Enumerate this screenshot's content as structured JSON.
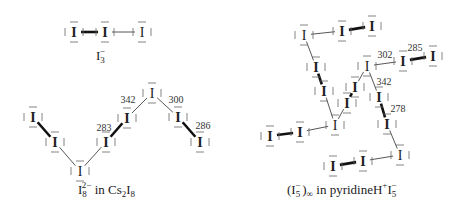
{
  "diagram": {
    "panels": [
      {
        "id": "i3",
        "caption": {
          "base": "I",
          "sub": "3",
          "sup": "−"
        },
        "atoms": [
          {
            "x": 74,
            "y": 32,
            "label": "I",
            "bold": true
          },
          {
            "x": 105,
            "y": 32,
            "label": "I",
            "bold": true
          },
          {
            "x": 142,
            "y": 32,
            "label": "I",
            "bold": false
          }
        ],
        "bonds": [
          {
            "a": 0,
            "b": 1,
            "type": "thick"
          },
          {
            "a": 1,
            "b": 2,
            "type": "thin"
          }
        ],
        "bond_lengths": []
      },
      {
        "id": "i8",
        "caption": {
          "base": "I",
          "sub": "8",
          "sup": "2−",
          "rest": " in Cs",
          "rest_sub": "2",
          "rest_end": "I",
          "rest_end_sub": "8"
        },
        "atoms": [
          {
            "x": 33,
            "y": 117,
            "label": "I",
            "bold": true
          },
          {
            "x": 55,
            "y": 142,
            "label": "I",
            "bold": true
          },
          {
            "x": 80,
            "y": 171,
            "label": "I",
            "bold": false
          },
          {
            "x": 106,
            "y": 142,
            "label": "I",
            "bold": true
          },
          {
            "x": 127,
            "y": 118,
            "label": "I",
            "bold": true
          },
          {
            "x": 152,
            "y": 93,
            "label": "I",
            "bold": false
          },
          {
            "x": 178,
            "y": 117,
            "label": "I",
            "bold": true
          },
          {
            "x": 200,
            "y": 142,
            "label": "I",
            "bold": true
          }
        ],
        "bonds": [
          {
            "a": 0,
            "b": 1,
            "type": "thick"
          },
          {
            "a": 1,
            "b": 2,
            "type": "thin"
          },
          {
            "a": 2,
            "b": 3,
            "type": "thin"
          },
          {
            "a": 3,
            "b": 4,
            "type": "thick"
          },
          {
            "a": 4,
            "b": 5,
            "type": "thin"
          },
          {
            "a": 5,
            "b": 6,
            "type": "thin"
          },
          {
            "a": 6,
            "b": 7,
            "type": "thick"
          }
        ],
        "bond_lengths": [
          {
            "x": 104,
            "y": 127,
            "value": "283"
          },
          {
            "x": 128,
            "y": 99,
            "value": "342"
          },
          {
            "x": 176,
            "y": 99,
            "value": "300"
          },
          {
            "x": 203,
            "y": 125,
            "value": "286"
          }
        ]
      },
      {
        "id": "i5chain",
        "caption": {
          "open": "(I",
          "sub": "5",
          "sup": "−",
          "close": ")",
          "close_sub": "∞",
          "rest": " in pyridineH",
          "rest_sup": "+",
          "rest_end": "I",
          "rest_end_sub": "5",
          "rest_end_sup": "−"
        },
        "atoms": [
          {
            "x": 304,
            "y": 35,
            "label": "I",
            "bold": false
          },
          {
            "x": 342,
            "y": 31,
            "label": "I",
            "bold": true
          },
          {
            "x": 372,
            "y": 26,
            "label": "I",
            "bold": true
          },
          {
            "x": 316,
            "y": 67,
            "label": "I",
            "bold": true
          },
          {
            "x": 324,
            "y": 91,
            "label": "I",
            "bold": true
          },
          {
            "x": 335,
            "y": 125,
            "label": "I",
            "bold": false
          },
          {
            "x": 347,
            "y": 103,
            "label": "I",
            "bold": true
          },
          {
            "x": 355,
            "y": 87,
            "label": "I",
            "bold": true
          },
          {
            "x": 367,
            "y": 66,
            "label": "I",
            "bold": false
          },
          {
            "x": 403,
            "y": 61,
            "label": "I",
            "bold": true
          },
          {
            "x": 433,
            "y": 56,
            "label": "I",
            "bold": true
          },
          {
            "x": 379,
            "y": 97,
            "label": "I",
            "bold": true
          },
          {
            "x": 387,
            "y": 124,
            "label": "I",
            "bold": true
          },
          {
            "x": 400,
            "y": 155,
            "label": "I",
            "bold": false
          },
          {
            "x": 363,
            "y": 161,
            "label": "I",
            "bold": true
          },
          {
            "x": 333,
            "y": 166,
            "label": "I",
            "bold": true
          },
          {
            "x": 300,
            "y": 132,
            "label": "I",
            "bold": true
          },
          {
            "x": 270,
            "y": 136,
            "label": "I",
            "bold": true
          }
        ],
        "bonds": [
          {
            "a": 0,
            "b": 1,
            "type": "thin"
          },
          {
            "a": 1,
            "b": 2,
            "type": "thick"
          },
          {
            "a": 0,
            "b": 3,
            "type": "thin"
          },
          {
            "a": 3,
            "b": 4,
            "type": "thick"
          },
          {
            "a": 4,
            "b": 5,
            "type": "thin"
          },
          {
            "a": 5,
            "b": 6,
            "type": "thin"
          },
          {
            "a": 6,
            "b": 7,
            "type": "thick"
          },
          {
            "a": 7,
            "b": 8,
            "type": "thin"
          },
          {
            "a": 8,
            "b": 9,
            "type": "thin"
          },
          {
            "a": 9,
            "b": 10,
            "type": "thick"
          },
          {
            "a": 8,
            "b": 11,
            "type": "thin"
          },
          {
            "a": 11,
            "b": 12,
            "type": "thick"
          },
          {
            "a": 12,
            "b": 13,
            "type": "thin"
          },
          {
            "a": 13,
            "b": 14,
            "type": "thin"
          },
          {
            "a": 14,
            "b": 15,
            "type": "thick"
          },
          {
            "a": 5,
            "b": 16,
            "type": "thin"
          },
          {
            "a": 16,
            "b": 17,
            "type": "thick"
          }
        ],
        "bond_lengths": [
          {
            "x": 385,
            "y": 54,
            "value": "302"
          },
          {
            "x": 415,
            "y": 47,
            "value": "285"
          },
          {
            "x": 384,
            "y": 81,
            "value": "342"
          },
          {
            "x": 398,
            "y": 108,
            "value": "278"
          }
        ]
      }
    ]
  }
}
